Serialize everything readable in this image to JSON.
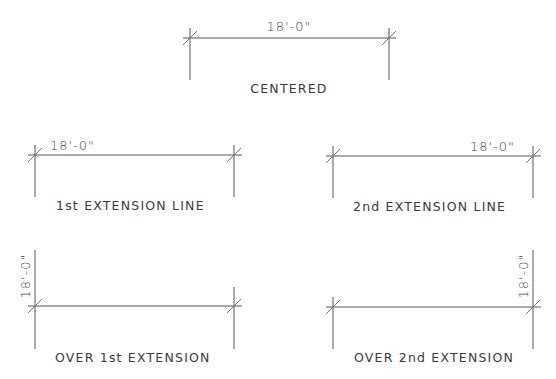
{
  "diagram": {
    "type": "architectural-dimension-text-placement",
    "line_color": "#555555",
    "text_color": "#3a3a3a",
    "background": "#ffffff",
    "examples": [
      {
        "id": "centered",
        "label": "CENTERED",
        "dimension_text": "18'-0\"",
        "text_placement": "centered above dimension line"
      },
      {
        "id": "first-extension",
        "label": "1st EXTENSION LINE",
        "dimension_text": "18'-0\"",
        "text_placement": "above line at 1st extension"
      },
      {
        "id": "second-extension",
        "label": "2nd EXTENSION LINE",
        "dimension_text": "18'-0\"",
        "text_placement": "above line at 2nd extension"
      },
      {
        "id": "over-first-extension",
        "label": "OVER 1st EXTENSION",
        "dimension_text": "18'-0\"",
        "text_placement": "vertical, over 1st extension line"
      },
      {
        "id": "over-second-extension",
        "label": "OVER 2nd EXTENSION",
        "dimension_text": "18'-0\"",
        "text_placement": "vertical, over 2nd extension line"
      }
    ]
  }
}
